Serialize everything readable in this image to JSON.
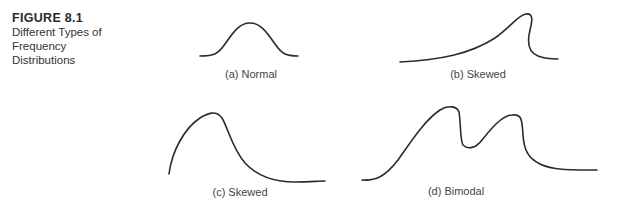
{
  "figure": {
    "number": "FIGURE 8.1",
    "title_lines": [
      "Different Types of",
      "Frequency",
      "Distributions"
    ]
  },
  "panels": [
    {
      "id": "a",
      "label": "(a) Normal"
    },
    {
      "id": "b",
      "label": "(b) Skewed"
    },
    {
      "id": "c",
      "label": "(c) Skewed"
    },
    {
      "id": "d",
      "label": "(d) Bimodal"
    }
  ],
  "colors": {
    "curve": "#2b2b2b",
    "text": "#333333"
  }
}
